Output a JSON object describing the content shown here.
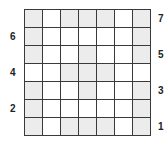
{
  "grid": {
    "rows": 7,
    "cols": 7,
    "shaded_color": "#ececec",
    "empty_color": "#ffffff",
    "line_color": "#3a3a3a",
    "cells": [
      [
        1,
        0,
        1,
        1,
        1,
        0,
        1
      ],
      [
        1,
        0,
        0,
        0,
        0,
        0,
        1
      ],
      [
        1,
        0,
        0,
        1,
        0,
        0,
        1
      ],
      [
        0,
        0,
        1,
        1,
        1,
        0,
        0
      ],
      [
        1,
        0,
        0,
        1,
        0,
        0,
        1
      ],
      [
        1,
        0,
        0,
        0,
        0,
        0,
        1
      ],
      [
        1,
        0,
        1,
        1,
        1,
        0,
        1
      ]
    ]
  },
  "row_labels": [
    {
      "text": "7",
      "side": "right",
      "row": 0
    },
    {
      "text": "6",
      "side": "left",
      "row": 1
    },
    {
      "text": "5",
      "side": "right",
      "row": 2
    },
    {
      "text": "4",
      "side": "left",
      "row": 3
    },
    {
      "text": "3",
      "side": "right",
      "row": 4
    },
    {
      "text": "2",
      "side": "left",
      "row": 5
    },
    {
      "text": "1",
      "side": "right",
      "row": 6
    }
  ]
}
